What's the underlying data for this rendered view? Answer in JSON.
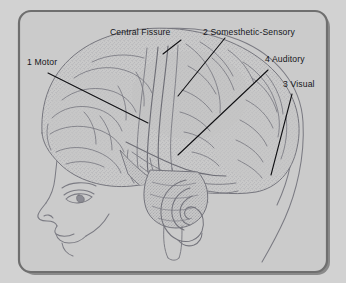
{
  "figure": {
    "frame": {
      "background_color": "#cfcfcf",
      "panel_color": "#cbcbcb",
      "border_color": "#6f6f6f",
      "border_shadow_color": "#4e4e4e",
      "outer_color": "#d2d2d2"
    },
    "drawing": {
      "ink_color": "#6a6a72",
      "stipple_color": "#8a8a92",
      "leader_color": "#111114",
      "parts": [
        "head-profile-outline",
        "skull-outline",
        "cerebrum",
        "frontal-lobe",
        "parietal-lobe",
        "temporal-lobe",
        "occipital-lobe",
        "cerebellum",
        "brainstem",
        "ear",
        "eye",
        "nose",
        "lips",
        "chin"
      ]
    },
    "labels": [
      {
        "id": "motor",
        "text": "1 Motor",
        "x": 27,
        "y": 62
      },
      {
        "id": "fissure",
        "text": "Central Fissure",
        "x": 110,
        "y": 28
      },
      {
        "id": "sensory",
        "text": "2 Somesthetic-Sensory",
        "x": 203,
        "y": 28
      },
      {
        "id": "auditory",
        "text": "4 Auditory",
        "x": 265,
        "y": 57
      },
      {
        "id": "visual",
        "text": "3 Visual",
        "x": 283,
        "y": 82
      }
    ],
    "leaders": [
      {
        "id": "motor-leader",
        "x1": 48,
        "y1": 73,
        "x2": 148,
        "y2": 123
      },
      {
        "id": "fissure-leader",
        "x1": 181,
        "y1": 40,
        "x2": 163,
        "y2": 54
      },
      {
        "id": "sensory-leader",
        "x1": 225,
        "y1": 38,
        "x2": 178,
        "y2": 96
      },
      {
        "id": "auditory-leader",
        "x1": 268,
        "y1": 70,
        "x2": 178,
        "y2": 155
      },
      {
        "id": "visual-leader",
        "x1": 292,
        "y1": 94,
        "x2": 271,
        "y2": 175
      }
    ]
  }
}
